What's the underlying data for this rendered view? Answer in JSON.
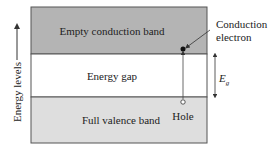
{
  "diagram": {
    "axis_label": "Energy levels",
    "bands": {
      "conduction": {
        "label": "Empty conduction band",
        "color": "#b4b4b4"
      },
      "gap": {
        "label": "Energy gap",
        "color": "#ffffff"
      },
      "valence": {
        "label": "Full valence band",
        "color": "#dedede"
      }
    },
    "annotations": {
      "electron_line1": "Conduction",
      "electron_line2": "electron",
      "hole": "Hole",
      "gap_symbol": "E",
      "gap_subscript": "g"
    },
    "border_color": "#555555"
  }
}
